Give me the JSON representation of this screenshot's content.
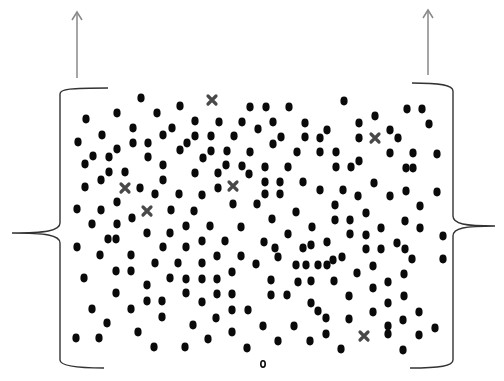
{
  "diagram": {
    "colors": {
      "background": "#ffffff",
      "dot": "#0a0a0a",
      "cross": "#2a2a2a",
      "brace": "#333333",
      "arrow": "#888888"
    },
    "arrows": [
      {
        "x": 77,
        "y_start": 78,
        "y_end": 12
      },
      {
        "x": 428,
        "y_start": 75,
        "y_end": 10
      }
    ],
    "left_brace": {
      "x": 60,
      "top": 88,
      "bottom": 368,
      "tip_x": 12,
      "tip_y": 233
    },
    "right_brace": {
      "x": 453,
      "top": 83,
      "bottom": 368,
      "tip_x": 495,
      "tip_y": 226
    },
    "crosses": [
      [
        212,
        100
      ],
      [
        375,
        138
      ],
      [
        125,
        188
      ],
      [
        233,
        186
      ],
      [
        147,
        211
      ],
      [
        364,
        336
      ]
    ],
    "hollow_dots": [
      [
        263,
        364
      ]
    ],
    "dots": [
      [
        141,
        98
      ],
      [
        86,
        119
      ],
      [
        117,
        113
      ],
      [
        157,
        113
      ],
      [
        180,
        106
      ],
      [
        250,
        107
      ],
      [
        266,
        107
      ],
      [
        289,
        107
      ],
      [
        344,
        101
      ],
      [
        407,
        109
      ],
      [
        422,
        109
      ],
      [
        375,
        116
      ],
      [
        429,
        124
      ],
      [
        102,
        135
      ],
      [
        133,
        128
      ],
      [
        195,
        121
      ],
      [
        219,
        122
      ],
      [
        242,
        122
      ],
      [
        273,
        122
      ],
      [
        305,
        123
      ],
      [
        359,
        123
      ],
      [
        172,
        128
      ],
      [
        163,
        135
      ],
      [
        258,
        129
      ],
      [
        327,
        130
      ],
      [
        390,
        130
      ],
      [
        398,
        138
      ],
      [
        195,
        136
      ],
      [
        211,
        136
      ],
      [
        234,
        136
      ],
      [
        281,
        137
      ],
      [
        305,
        137
      ],
      [
        320,
        138
      ],
      [
        359,
        138
      ],
      [
        78,
        142
      ],
      [
        133,
        143
      ],
      [
        148,
        143
      ],
      [
        187,
        143
      ],
      [
        180,
        150
      ],
      [
        273,
        144
      ],
      [
        93,
        156
      ],
      [
        109,
        157
      ],
      [
        117,
        149
      ],
      [
        148,
        157
      ],
      [
        211,
        151
      ],
      [
        227,
        151
      ],
      [
        250,
        152
      ],
      [
        297,
        152
      ],
      [
        320,
        152
      ],
      [
        336,
        152
      ],
      [
        390,
        153
      ],
      [
        413,
        153
      ],
      [
        437,
        154
      ],
      [
        203,
        158
      ],
      [
        85,
        164
      ],
      [
        163,
        165
      ],
      [
        226,
        165
      ],
      [
        242,
        166
      ],
      [
        265,
        167
      ],
      [
        288,
        167
      ],
      [
        336,
        167
      ],
      [
        351,
        167
      ],
      [
        359,
        161
      ],
      [
        406,
        168
      ],
      [
        413,
        168
      ],
      [
        109,
        172
      ],
      [
        125,
        172
      ],
      [
        195,
        173
      ],
      [
        218,
        173
      ],
      [
        249,
        174
      ],
      [
        101,
        180
      ],
      [
        163,
        180
      ],
      [
        265,
        182
      ],
      [
        280,
        182
      ],
      [
        303,
        182
      ],
      [
        374,
        183
      ],
      [
        140,
        188
      ],
      [
        85,
        187
      ],
      [
        218,
        188
      ],
      [
        320,
        190
      ],
      [
        343,
        190
      ],
      [
        406,
        191
      ],
      [
        437,
        192
      ],
      [
        155,
        194
      ],
      [
        179,
        194
      ],
      [
        202,
        195
      ],
      [
        265,
        194
      ],
      [
        280,
        194
      ],
      [
        358,
        196
      ],
      [
        390,
        196
      ],
      [
        117,
        202
      ],
      [
        233,
        204
      ],
      [
        257,
        204
      ],
      [
        335,
        205
      ],
      [
        420,
        206
      ],
      [
        77,
        209
      ],
      [
        101,
        210
      ],
      [
        171,
        210
      ],
      [
        194,
        211
      ],
      [
        132,
        218
      ],
      [
        296,
        212
      ],
      [
        366,
        213
      ],
      [
        272,
        219
      ],
      [
        335,
        220
      ],
      [
        350,
        220
      ],
      [
        405,
        221
      ],
      [
        92,
        224
      ],
      [
        117,
        224
      ],
      [
        186,
        226
      ],
      [
        210,
        226
      ],
      [
        241,
        227
      ],
      [
        312,
        227
      ],
      [
        381,
        228
      ],
      [
        420,
        228
      ],
      [
        147,
        233
      ],
      [
        170,
        233
      ],
      [
        288,
        234
      ],
      [
        350,
        234
      ],
      [
        366,
        235
      ],
      [
        108,
        239
      ],
      [
        116,
        239
      ],
      [
        202,
        241
      ],
      [
        225,
        241
      ],
      [
        264,
        242
      ],
      [
        327,
        242
      ],
      [
        443,
        236
      ],
      [
        397,
        243
      ],
      [
        77,
        247
      ],
      [
        163,
        247
      ],
      [
        186,
        247
      ],
      [
        311,
        245
      ],
      [
        275,
        248
      ],
      [
        303,
        248
      ],
      [
        366,
        249
      ],
      [
        381,
        249
      ],
      [
        405,
        249
      ],
      [
        100,
        255
      ],
      [
        131,
        255
      ],
      [
        217,
        256
      ],
      [
        241,
        256
      ],
      [
        278,
        257
      ],
      [
        342,
        257
      ],
      [
        412,
        259
      ],
      [
        443,
        259
      ],
      [
        155,
        263
      ],
      [
        178,
        263
      ],
      [
        202,
        263
      ],
      [
        256,
        264
      ],
      [
        296,
        265
      ],
      [
        306,
        265
      ],
      [
        318,
        265
      ],
      [
        327,
        265
      ],
      [
        333,
        260
      ],
      [
        373,
        266
      ],
      [
        116,
        271
      ],
      [
        131,
        271
      ],
      [
        232,
        272
      ],
      [
        357,
        273
      ],
      [
        404,
        274
      ],
      [
        84,
        278
      ],
      [
        170,
        278
      ],
      [
        186,
        279
      ],
      [
        202,
        279
      ],
      [
        217,
        279
      ],
      [
        271,
        280
      ],
      [
        311,
        281
      ],
      [
        334,
        281
      ],
      [
        298,
        282
      ],
      [
        388,
        282
      ],
      [
        147,
        285
      ],
      [
        373,
        288
      ],
      [
        116,
        293
      ],
      [
        186,
        293
      ],
      [
        217,
        294
      ],
      [
        232,
        294
      ],
      [
        271,
        295
      ],
      [
        287,
        295
      ],
      [
        349,
        296
      ],
      [
        404,
        296
      ],
      [
        147,
        301
      ],
      [
        162,
        301
      ],
      [
        202,
        302
      ],
      [
        311,
        303
      ],
      [
        388,
        303
      ],
      [
        92,
        309
      ],
      [
        131,
        309
      ],
      [
        232,
        310
      ],
      [
        248,
        310
      ],
      [
        318,
        311
      ],
      [
        373,
        312
      ],
      [
        419,
        312
      ],
      [
        107,
        323
      ],
      [
        162,
        317
      ],
      [
        216,
        318
      ],
      [
        193,
        325
      ],
      [
        263,
        326
      ],
      [
        294,
        326
      ],
      [
        326,
        318
      ],
      [
        349,
        319
      ],
      [
        403,
        320
      ],
      [
        388,
        326
      ],
      [
        435,
        328
      ],
      [
        138,
        332
      ],
      [
        232,
        332
      ],
      [
        326,
        334
      ],
      [
        388,
        334
      ],
      [
        419,
        335
      ],
      [
        76,
        338
      ],
      [
        99,
        338
      ],
      [
        208,
        339
      ],
      [
        278,
        341
      ],
      [
        310,
        341
      ],
      [
        154,
        347
      ],
      [
        185,
        347
      ],
      [
        247,
        348
      ],
      [
        341,
        349
      ],
      [
        403,
        350
      ]
    ]
  }
}
